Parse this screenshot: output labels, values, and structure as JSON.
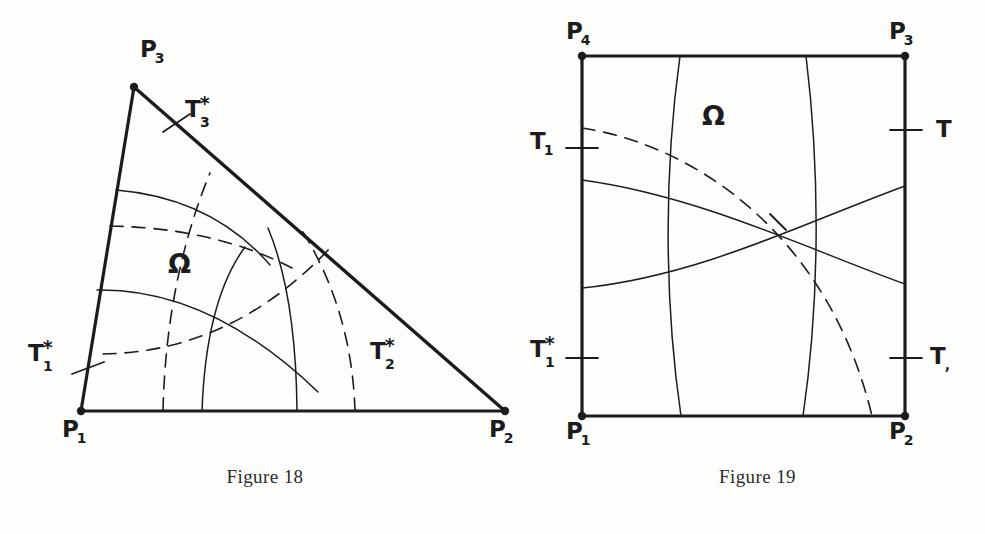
{
  "page": {
    "background": "#fdfdfc",
    "ink": "#1c1c1c",
    "width": 985,
    "height": 534
  },
  "figure18": {
    "caption": "Figure 18",
    "omega": "Ω",
    "shape": "right-triangle",
    "vertices": [
      {
        "name": "P1",
        "base": "P",
        "sub": "1",
        "x": 81,
        "y": 411
      },
      {
        "name": "P2",
        "base": "P",
        "sub": "2",
        "x": 505,
        "y": 411
      },
      {
        "name": "P3",
        "base": "P",
        "sub": "3",
        "x": 134,
        "y": 87
      }
    ],
    "vertex_labels": [
      {
        "base": "P",
        "sub": "1",
        "star": "",
        "x": 62,
        "y": 418
      },
      {
        "base": "P",
        "sub": "2",
        "star": "",
        "x": 489,
        "y": 418
      },
      {
        "base": "P",
        "sub": "3",
        "star": "",
        "x": 140,
        "y": 38
      }
    ],
    "tick_labels": [
      {
        "base": "T",
        "sub": "1",
        "star": "*",
        "x": 28,
        "y": 342
      },
      {
        "base": "T",
        "sub": "2",
        "star": "*",
        "x": 370,
        "y": 340
      },
      {
        "base": "T",
        "sub": "3",
        "star": "*",
        "x": 185,
        "y": 98
      }
    ],
    "omega_pos": {
      "x": 168,
      "y": 248
    }
  },
  "figure19": {
    "caption": "Figure 19",
    "omega": "Ω",
    "shape": "square",
    "square": {
      "left": 582,
      "top": 56,
      "right": 905,
      "bottom": 416
    },
    "vertex_labels": [
      {
        "base": "P",
        "sub": "1",
        "star": "",
        "x": 566,
        "y": 420
      },
      {
        "base": "P",
        "sub": "2",
        "star": "",
        "x": 889,
        "y": 420
      },
      {
        "base": "P",
        "sub": "3",
        "star": "",
        "x": 889,
        "y": 20
      },
      {
        "base": "P",
        "sub": "4",
        "star": "",
        "x": 566,
        "y": 20
      }
    ],
    "tick_labels": [
      {
        "base": "T",
        "sub": "1",
        "star": "",
        "x": 530,
        "y": 130
      },
      {
        "base": "T",
        "sub": "1",
        "star": "*",
        "x": 528,
        "y": 340
      },
      {
        "base": "T",
        "sub": "",
        "star": "",
        "x": 936,
        "y": 118
      },
      {
        "base": "T",
        "sub": "",
        "star": "",
        "x": 930,
        "y": 345
      }
    ],
    "omega_pos": {
      "x": 702,
      "y": 100
    }
  }
}
